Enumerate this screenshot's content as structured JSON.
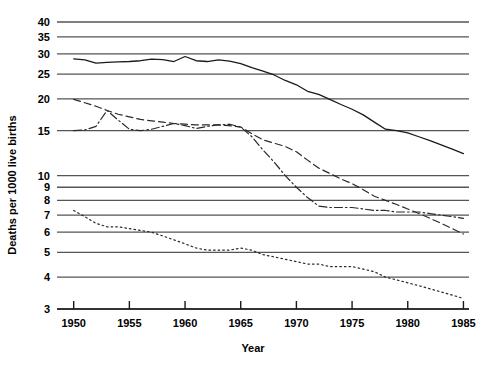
{
  "chart_data": {
    "type": "line",
    "title": "",
    "xlabel": "Year",
    "ylabel": "Deaths per 1000 live births",
    "yscale": "log",
    "ylim": [
      3,
      40
    ],
    "xlim": [
      1948.5,
      1985.5
    ],
    "grid": true,
    "legend": "none",
    "xticks": [
      1950,
      1955,
      1960,
      1965,
      1970,
      1975,
      1980,
      1985
    ],
    "xtick_labels": [
      "1950",
      "1955",
      "1960",
      "1965",
      "1970",
      "1975",
      "1980",
      "1985"
    ],
    "yticks": [
      3,
      4,
      5,
      6,
      7,
      8,
      9,
      10,
      15,
      20,
      25,
      30,
      35,
      40
    ],
    "ytick_labels": [
      "3",
      "4",
      "5",
      "6",
      "7",
      "8",
      "9",
      "10",
      "15",
      "20",
      "25",
      "30",
      "35",
      "40"
    ],
    "x": [
      1950,
      1951,
      1952,
      1953,
      1954,
      1955,
      1956,
      1957,
      1958,
      1959,
      1960,
      1961,
      1962,
      1963,
      1964,
      1965,
      1966,
      1967,
      1968,
      1969,
      1970,
      1971,
      1972,
      1973,
      1974,
      1975,
      1976,
      1977,
      1978,
      1979,
      1980,
      1981,
      1982,
      1983,
      1984,
      1985
    ],
    "series": [
      {
        "name": "series-solid",
        "style": "solid",
        "color": "#1a1a1a",
        "values": [
          28.7,
          28.4,
          27.6,
          27.8,
          27.9,
          28.0,
          28.2,
          28.6,
          28.5,
          28.0,
          29.3,
          28.2,
          28.0,
          28.4,
          28.1,
          27.5,
          26.5,
          25.7,
          24.8,
          23.6,
          22.7,
          21.4,
          20.8,
          19.9,
          19.0,
          18.2,
          17.3,
          16.2,
          15.2,
          15.0,
          14.7,
          14.2,
          13.7,
          13.2,
          12.7,
          12.2
        ]
      },
      {
        "name": "series-dashed",
        "style": "dashed",
        "color": "#2a2a2a",
        "values": [
          19.9,
          19.3,
          18.7,
          18.0,
          17.4,
          17.0,
          16.6,
          16.4,
          16.2,
          16.0,
          15.9,
          15.8,
          15.8,
          15.8,
          15.7,
          15.5,
          14.6,
          13.8,
          13.4,
          13.0,
          12.4,
          11.5,
          10.7,
          10.2,
          9.7,
          9.3,
          8.8,
          8.3,
          8.0,
          7.7,
          7.4,
          7.1,
          6.8,
          6.5,
          6.2,
          5.9
        ]
      },
      {
        "name": "series-dash-dot",
        "style": "dashdot",
        "color": "#2a2a2a",
        "values": [
          15.0,
          15.1,
          15.6,
          18.0,
          16.5,
          15.2,
          15.0,
          15.2,
          15.6,
          16.0,
          15.7,
          15.3,
          15.6,
          15.8,
          15.9,
          15.5,
          14.2,
          12.6,
          11.3,
          10.0,
          9.0,
          8.2,
          7.6,
          7.5,
          7.5,
          7.5,
          7.4,
          7.3,
          7.3,
          7.2,
          7.2,
          7.2,
          7.1,
          7.0,
          6.9,
          6.8
        ]
      },
      {
        "name": "series-dotted",
        "style": "dotted",
        "color": "#2a2a2a",
        "values": [
          7.3,
          6.9,
          6.5,
          6.3,
          6.3,
          6.2,
          6.1,
          6.0,
          5.8,
          5.6,
          5.4,
          5.2,
          5.1,
          5.1,
          5.1,
          5.2,
          5.1,
          4.9,
          4.8,
          4.7,
          4.6,
          4.5,
          4.5,
          4.4,
          4.4,
          4.4,
          4.3,
          4.2,
          4.0,
          3.9,
          3.8,
          3.7,
          3.6,
          3.5,
          3.4,
          3.3
        ]
      }
    ]
  }
}
